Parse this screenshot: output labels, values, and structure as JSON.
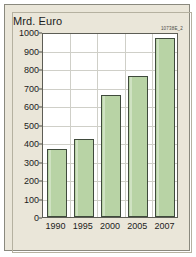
{
  "chart_data": {
    "type": "bar",
    "title": "",
    "unit_label": "Mrd. Euro",
    "graphic_id": "10738E_2",
    "categories": [
      "1990",
      "1995",
      "2000",
      "2005",
      "2007"
    ],
    "values": [
      370,
      420,
      660,
      760,
      970
    ],
    "xlabel": "",
    "ylabel": "Mrd. Euro",
    "ylim": [
      0,
      1000
    ],
    "ytick_values": [
      0,
      100,
      200,
      300,
      400,
      500,
      600,
      700,
      800,
      900,
      1000
    ],
    "ytick_labels": [
      "0",
      "100",
      "200",
      "300",
      "400",
      "500",
      "600",
      "700",
      "800",
      "900",
      "1000"
    ],
    "grid": true,
    "legend": "none",
    "series": [
      {
        "name": "Mrd. Euro",
        "values": [
          370,
          420,
          660,
          760,
          970
        ]
      }
    ],
    "colors": {
      "bar_fill": "#b8d3a5",
      "bar_border": "#3f4a3c",
      "plot_background": "#ffffff",
      "card_background": "#eae6d9",
      "gridline": "#cfcfc8",
      "axis": "#5d5d55",
      "text": "#1c1c1c"
    }
  }
}
